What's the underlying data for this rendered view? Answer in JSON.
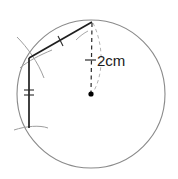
{
  "figure": {
    "type": "circle-construction-diagram",
    "background_color": "#ffffff",
    "labels": {
      "radius_label": "2cm"
    },
    "colors": {
      "circle_stroke": "#8a8a8a",
      "chord_stroke": "#1f1f1f",
      "vertical_stroke": "#1f1f1f",
      "construction_arc_stroke": "#9a9a9a",
      "dashed_stroke": "#2b2b2b",
      "dashed_arc_stroke": "#b0b0b0",
      "center_dot": "#000000",
      "text": "#1a1a1a"
    },
    "circle": {
      "center_x": 91,
      "center_y": 94,
      "radius": 74
    },
    "points": {
      "top_vertex": {
        "x": 92,
        "y": 22
      },
      "left_vertex": {
        "x": 29,
        "y": 58
      },
      "bottom_vertex": {
        "x": 29,
        "y": 128
      },
      "center": {
        "x": 91,
        "y": 94
      }
    },
    "tick_marks": {
      "chord_ticks": 1,
      "vertical_ticks": 2,
      "radius_ticks": 1
    }
  }
}
